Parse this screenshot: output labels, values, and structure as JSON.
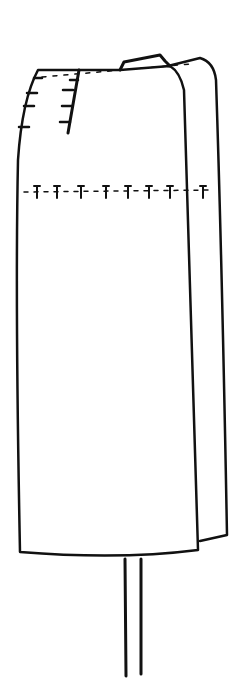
{
  "figure": {
    "stroke_color": "#111111",
    "background": "#ffffff",
    "marks": {
      "waist_tacks_left": 4,
      "dart_tacks": 4,
      "hip_tacks": 9
    }
  }
}
